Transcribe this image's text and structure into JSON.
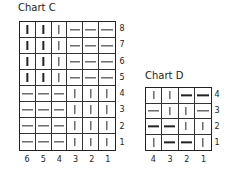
{
  "charts": [
    {
      "title": "Chart C",
      "columns": 6,
      "rows": 8,
      "row_labels": [
        "8",
        "7",
        "6",
        "5",
        "4",
        "3",
        "2",
        "1"
      ],
      "col_labels": [
        "6",
        "5",
        "4",
        "3",
        "2",
        "1"
      ],
      "grid": [
        [
          "V",
          "V",
          "V",
          "H",
          "H",
          "H"
        ],
        [
          "V",
          "V",
          "V",
          "H",
          "H",
          "H"
        ],
        [
          "V",
          "V",
          "V",
          "H",
          "H",
          "H"
        ],
        [
          "V",
          "V",
          "V",
          "H",
          "H",
          "H"
        ],
        [
          "H",
          "H",
          "H",
          "V",
          "V",
          "V"
        ],
        [
          "H",
          "H",
          "H",
          "V",
          "V",
          "V"
        ],
        [
          "H",
          "H",
          "H",
          "V",
          "V",
          "V"
        ],
        [
          "H",
          "H",
          "H",
          "V",
          "V",
          "V"
        ]
      ]
    },
    {
      "title": "Chart D",
      "columns": 4,
      "rows": 4,
      "row_labels": [
        "4",
        "3",
        "2",
        "1"
      ],
      "col_labels": [
        "4",
        "3",
        "2",
        "1"
      ],
      "grid": [
        [
          "V",
          "V",
          "H",
          "H"
        ],
        [
          "H",
          "V",
          "V",
          "H"
        ],
        [
          "H",
          "H",
          "V",
          "V"
        ],
        [
          "V",
          "H",
          "H",
          "V"
        ]
      ]
    }
  ],
  "legend": {
    "V": "vertical-stitch-symbol",
    "H": "horizontal-stitch-symbol"
  }
}
